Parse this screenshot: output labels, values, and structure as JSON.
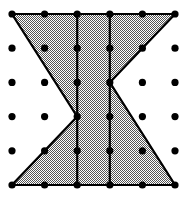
{
  "figure": {
    "title": "Geoboard hourglass figure",
    "caption": "",
    "width": 192,
    "height": 198,
    "background_color": "#ffffff"
  },
  "grid": {
    "name": "dot-grid",
    "rows": 6,
    "cols": 6,
    "dot_color": "#000000",
    "dot_radius": 3.6,
    "x_positions": [
      12,
      44.6,
      77.2,
      109.8,
      142.4,
      175
    ],
    "y_positions": [
      14,
      48.2,
      82.4,
      116.6,
      150.8,
      185
    ],
    "dots": [
      {
        "col": 0,
        "row": 0,
        "cx": 12,
        "cy": 14
      },
      {
        "col": 1,
        "row": 0,
        "cx": 44.6,
        "cy": 14
      },
      {
        "col": 2,
        "row": 0,
        "cx": 77.2,
        "cy": 14
      },
      {
        "col": 3,
        "row": 0,
        "cx": 109.8,
        "cy": 14
      },
      {
        "col": 4,
        "row": 0,
        "cx": 142.4,
        "cy": 14
      },
      {
        "col": 5,
        "row": 0,
        "cx": 175,
        "cy": 14
      },
      {
        "col": 0,
        "row": 1,
        "cx": 12,
        "cy": 48.2
      },
      {
        "col": 1,
        "row": 1,
        "cx": 44.6,
        "cy": 48.2
      },
      {
        "col": 2,
        "row": 1,
        "cx": 77.2,
        "cy": 48.2
      },
      {
        "col": 3,
        "row": 1,
        "cx": 109.8,
        "cy": 48.2
      },
      {
        "col": 4,
        "row": 1,
        "cx": 142.4,
        "cy": 48.2
      },
      {
        "col": 5,
        "row": 1,
        "cx": 175,
        "cy": 48.2
      },
      {
        "col": 0,
        "row": 2,
        "cx": 12,
        "cy": 82.4
      },
      {
        "col": 1,
        "row": 2,
        "cx": 44.6,
        "cy": 82.4
      },
      {
        "col": 2,
        "row": 2,
        "cx": 77.2,
        "cy": 82.4
      },
      {
        "col": 3,
        "row": 2,
        "cx": 109.8,
        "cy": 82.4
      },
      {
        "col": 4,
        "row": 2,
        "cx": 142.4,
        "cy": 82.4
      },
      {
        "col": 5,
        "row": 2,
        "cx": 175,
        "cy": 82.4
      },
      {
        "col": 0,
        "row": 3,
        "cx": 12,
        "cy": 116.6
      },
      {
        "col": 1,
        "row": 3,
        "cx": 44.6,
        "cy": 116.6
      },
      {
        "col": 2,
        "row": 3,
        "cx": 77.2,
        "cy": 116.6
      },
      {
        "col": 3,
        "row": 3,
        "cx": 109.8,
        "cy": 116.6
      },
      {
        "col": 4,
        "row": 3,
        "cx": 142.4,
        "cy": 116.6
      },
      {
        "col": 5,
        "row": 3,
        "cx": 175,
        "cy": 116.6
      },
      {
        "col": 0,
        "row": 4,
        "cx": 12,
        "cy": 150.8
      },
      {
        "col": 1,
        "row": 4,
        "cx": 44.6,
        "cy": 150.8
      },
      {
        "col": 2,
        "row": 4,
        "cx": 77.2,
        "cy": 150.8
      },
      {
        "col": 3,
        "row": 4,
        "cx": 109.8,
        "cy": 150.8
      },
      {
        "col": 4,
        "row": 4,
        "cx": 142.4,
        "cy": 150.8
      },
      {
        "col": 5,
        "row": 4,
        "cx": 175,
        "cy": 150.8
      },
      {
        "col": 0,
        "row": 5,
        "cx": 12,
        "cy": 185
      },
      {
        "col": 1,
        "row": 5,
        "cx": 44.6,
        "cy": 185
      },
      {
        "col": 2,
        "row": 5,
        "cx": 77.2,
        "cy": 185
      },
      {
        "col": 3,
        "row": 5,
        "cx": 109.8,
        "cy": 185
      },
      {
        "col": 4,
        "row": 5,
        "cx": 142.4,
        "cy": 185
      },
      {
        "col": 5,
        "row": 5,
        "cx": 175,
        "cy": 185
      }
    ]
  },
  "shape": {
    "name": "hourglass-polygon",
    "label": "Hourglass / bowtie region",
    "fill_color": "#9a9a9a",
    "fill_pattern": "checkerboard-dither-50",
    "stroke_color": "#000000",
    "stroke_width": 2.2,
    "vertices_grid": [
      [
        0,
        0
      ],
      [
        5,
        0
      ],
      [
        3,
        2
      ],
      [
        5,
        5
      ],
      [
        0,
        5
      ],
      [
        2,
        3
      ]
    ],
    "path": "M 12,14 L 175,14 L 109.8,82.4 L 175,185 L 12,185 L 77.2,116.6 Z",
    "vertices_px": [
      {
        "x": 12,
        "y": 14
      },
      {
        "x": 175,
        "y": 14
      },
      {
        "x": 109.8,
        "y": 82.4
      },
      {
        "x": 175,
        "y": 185
      },
      {
        "x": 12,
        "y": 185
      },
      {
        "x": 77.2,
        "y": 116.6
      }
    ]
  },
  "chords": {
    "name": "interior-vertical-lines",
    "stroke_color": "#000000",
    "stroke_width": 2.2,
    "lines": [
      {
        "label": "vertical-col-2",
        "x1": 77.2,
        "y1": 14,
        "x2": 77.2,
        "y2": 185
      },
      {
        "label": "vertical-col-3",
        "x1": 109.8,
        "y1": 14,
        "x2": 109.8,
        "y2": 185
      }
    ]
  }
}
